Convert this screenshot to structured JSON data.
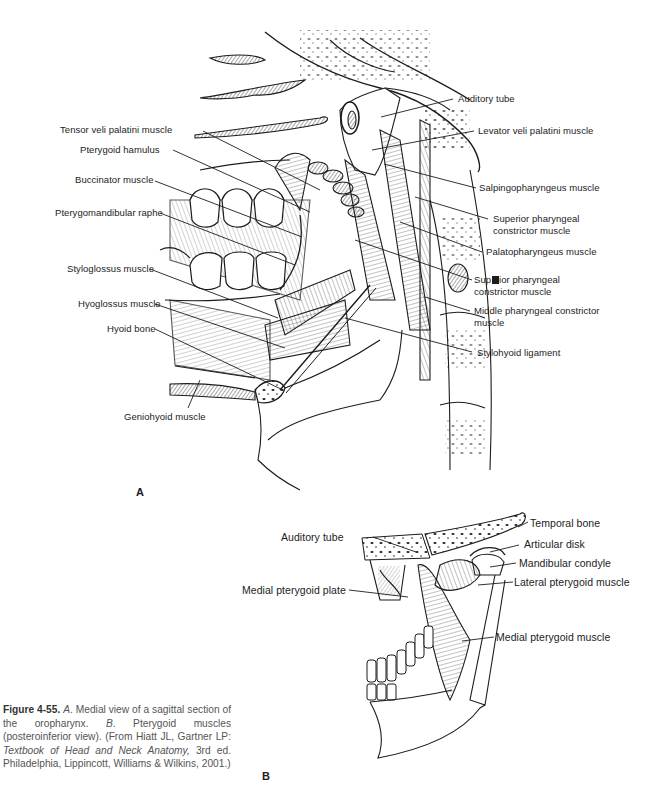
{
  "figure": {
    "number": "Figure 4-55.",
    "caption": {
      "part_a_letter": "A",
      "part_a_text": ". Medial view of a sagittal section of the oropharynx. ",
      "part_b_letter": "B",
      "part_b_text": ". Pterygoid muscles (posteroinferior view). (From Hiatt JL, Gartner LP: ",
      "book_title": "Textbook of Head and Neck Anatomy,",
      "citation_tail": " 3rd ed. Philadelphia, Lippincott, Williams & Wilkins, 2001.)"
    }
  },
  "panel_a": {
    "letter": "A",
    "description": "Medial view of a sagittal section of the oropharynx",
    "labels_left": [
      "Tensor veli palatini muscle",
      "Pterygoid hamulus",
      "Buccinator muscle",
      "Pterygomandibular raphe",
      "Styloglossus muscle",
      "Hyoglossus muscle",
      "Hyoid bone",
      "Geniohyoid muscle"
    ],
    "labels_right": [
      "Auditory tube",
      "Levator veli palatini muscle",
      "Salpingopharyngeus muscle",
      "Superior pharyngeal constrictor muscle",
      "Palatopharyngeus muscle",
      "Superior pharyngeal constrictor muscle (2)",
      "Middle pharyngeal constrictor muscle",
      "Stylohyoid ligament"
    ],
    "rendered": {
      "auditory_tube": "Auditory tube",
      "levator": "Levator veli palatini muscle",
      "salpingo": "Salpingopharyngeus muscle",
      "sup_constrictor_1": "Superior pharyngeal constrictor muscle",
      "palatopharyngeus": "Palatopharyngeus muscle",
      "sup_constrictor_2_pre": "Sup",
      "sup_constrictor_2_post": "ior pharyngeal constrictor muscle",
      "middle_constrictor": "Middle pharyngeal constrictor muscle",
      "stylohyoid": "Stylohyoid ligament",
      "tensor": "Tensor veli palatini muscle",
      "hamulus": "Pterygoid hamulus",
      "buccinator": "Buccinator muscle",
      "raphe": "Pterygomandibular raphe",
      "styloglossus": "Styloglossus muscle",
      "hyoglossus": "Hyoglossus muscle",
      "hyoid": "Hyoid bone",
      "geniohyoid": "Geniohyoid muscle"
    }
  },
  "panel_b": {
    "letter": "B",
    "description": "Pterygoid muscles (posteroinferior view)",
    "rendered": {
      "temporal_bone": "Temporal bone",
      "articular_disk": "Articular disk",
      "mandibular_condyle": "Mandibular condyle",
      "lateral_pterygoid": "Lateral pterygoid muscle",
      "medial_pterygoid": "Medial pterygoid muscle",
      "auditory_tube": "Auditory tube",
      "medial_pterygoid_plate": "Medial pterygoid plate"
    }
  },
  "colors": {
    "ink": "#1c1c1c",
    "caption_text": "#555555",
    "background": "#ffffff"
  }
}
